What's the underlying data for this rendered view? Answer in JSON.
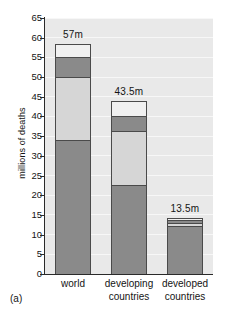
{
  "caption": "(a)",
  "chart_data": {
    "type": "bar",
    "subtype": "stacked",
    "title": "",
    "xlabel": "",
    "ylabel": "millions of deaths",
    "ylim": [
      0,
      65
    ],
    "ytick_step": 5,
    "yticks": [
      0,
      5,
      10,
      15,
      20,
      25,
      30,
      35,
      40,
      45,
      50,
      55,
      60,
      65
    ],
    "grid": true,
    "grid_axis": "y",
    "legend": "none",
    "categories": [
      "world",
      "developing countries",
      "developed countries"
    ],
    "category_lines": [
      [
        "world"
      ],
      [
        "developing",
        "countries"
      ],
      [
        "developed",
        "countries"
      ]
    ],
    "totals": [
      57,
      43.5,
      13.5
    ],
    "total_labels": [
      "57m",
      "43.5m",
      "13.5m"
    ],
    "series": [
      {
        "name": "segment-1",
        "color": "#8a8a8a",
        "values": [
          34.1,
          22.7,
          12.3
        ]
      },
      {
        "name": "segment-2",
        "color": "#d6d6d6",
        "values": [
          15.9,
          13.5,
          0.7
        ]
      },
      {
        "name": "segment-3",
        "color": "#8a8a8a",
        "values": [
          5.2,
          3.8,
          0.6
        ]
      },
      {
        "name": "segment-4",
        "color": "#f0f0f0",
        "values": [
          3.1,
          3.8,
          0.7
        ]
      }
    ],
    "bar_tops": [
      58.3,
      43.8,
      14.3
    ],
    "plot_bg": "#e9e9e9",
    "gridline_color": "#f7f7f7",
    "axis_color": "#2a2a2a",
    "bar_edge_color": "#4a4a4a",
    "text_color": "#141414"
  }
}
